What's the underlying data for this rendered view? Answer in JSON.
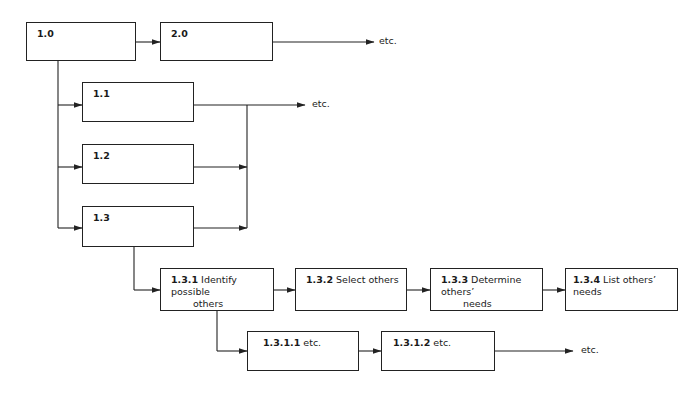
{
  "diagram": {
    "type": "hierarchical task breakdown flowchart",
    "nodes": [
      {
        "id": "1.0",
        "number": "1.0",
        "label": ""
      },
      {
        "id": "2.0",
        "number": "2.0",
        "label": ""
      },
      {
        "id": "1.1",
        "number": "1.1",
        "label": ""
      },
      {
        "id": "1.2",
        "number": "1.2",
        "label": ""
      },
      {
        "id": "1.3",
        "number": "1.3",
        "label": ""
      },
      {
        "id": "1.3.1",
        "number": "1.3.1",
        "label": "Identify possible",
        "label_cont": "others"
      },
      {
        "id": "1.3.2",
        "number": "1.3.2",
        "label": "Select others"
      },
      {
        "id": "1.3.3",
        "number": "1.3.3",
        "label": "Determine others’",
        "label_cont": "needs"
      },
      {
        "id": "1.3.4",
        "number": "1.3.4",
        "label": "List others’ needs"
      },
      {
        "id": "1.3.1.1",
        "number": "1.3.1.1",
        "label": "etc."
      },
      {
        "id": "1.3.1.2",
        "number": "1.3.1.2",
        "label": "etc."
      }
    ],
    "continuation_labels": {
      "after_2_0": "etc.",
      "after_1_x": "etc.",
      "after_1_3_1_2": "etc."
    },
    "edges": [
      [
        "1.0",
        "2.0"
      ],
      [
        "2.0",
        "etc."
      ],
      [
        "1.0",
        "1.1"
      ],
      [
        "1.0",
        "1.2"
      ],
      [
        "1.0",
        "1.3"
      ],
      [
        "1.1",
        "etc."
      ],
      [
        "1.2",
        "etc."
      ],
      [
        "1.3",
        "etc."
      ],
      [
        "1.3",
        "1.3.1"
      ],
      [
        "1.3.1",
        "1.3.2"
      ],
      [
        "1.3.2",
        "1.3.3"
      ],
      [
        "1.3.3",
        "1.3.4"
      ],
      [
        "1.3.1",
        "1.3.1.1"
      ],
      [
        "1.3.1.1",
        "1.3.1.2"
      ],
      [
        "1.3.1.2",
        "etc."
      ]
    ]
  }
}
